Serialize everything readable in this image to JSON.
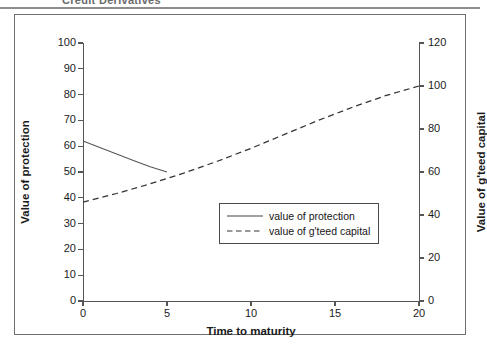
{
  "header": {
    "title": "Credit Derivatives"
  },
  "chart_data": {
    "type": "line",
    "title": "",
    "xlabel": "Time to maturity",
    "ylabel": "Value of protection",
    "ylabel_secondary": "Value of g'teed capital",
    "xlim": [
      0,
      20
    ],
    "ylim": [
      0,
      100
    ],
    "ylim_secondary": [
      0,
      120
    ],
    "xticks": [
      0,
      5,
      10,
      15,
      20
    ],
    "yticks": [
      0,
      10,
      20,
      30,
      40,
      50,
      60,
      70,
      80,
      90,
      100
    ],
    "yticks_secondary": [
      0,
      20,
      40,
      60,
      80,
      100,
      120
    ],
    "grid": false,
    "legend_position": "center",
    "series": [
      {
        "name": "value of protection",
        "style": "solid",
        "axis": "left",
        "color": "#555555",
        "x": [
          0,
          1,
          2,
          3,
          4,
          5
        ],
        "values": [
          62,
          59.5,
          57,
          54.5,
          52,
          50
        ]
      },
      {
        "name": "value of g'teed capital",
        "style": "dashed",
        "axis": "right",
        "color": "#333333",
        "x": [
          0,
          2,
          4,
          6,
          8,
          10,
          12,
          14,
          16,
          18,
          20
        ],
        "values": [
          46,
          50,
          54.5,
          59.5,
          65,
          71,
          77.5,
          84,
          90,
          95.5,
          100
        ]
      }
    ]
  },
  "legend": {
    "items": [
      {
        "label": "value of protection",
        "style": "solid"
      },
      {
        "label": "value of g'teed capital",
        "style": "dashed"
      }
    ]
  }
}
